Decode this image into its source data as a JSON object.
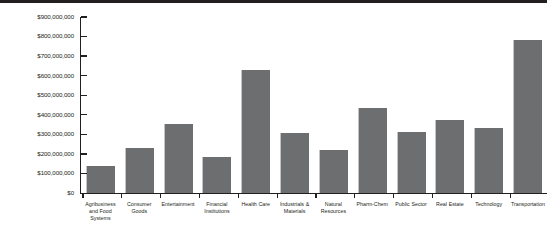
{
  "chart_data": {
    "type": "bar",
    "title": "",
    "subtitle": "",
    "xlabel": "",
    "ylabel": "",
    "categories": [
      "Agribusiness and Food Systems",
      "Consumer Goods",
      "Entertainment",
      "Financial Institutions",
      "Health Care",
      "Industrials & Materials",
      "Natural Resources",
      "Pharm-Chem",
      "Public Sector",
      "Real Estate",
      "Technology",
      "Transportation"
    ],
    "values": [
      140000000,
      230000000,
      355000000,
      185000000,
      630000000,
      305000000,
      220000000,
      435000000,
      310000000,
      375000000,
      335000000,
      780000000
    ],
    "ylim": [
      0,
      900000000
    ],
    "ytick_values": [
      0,
      100000000,
      200000000,
      300000000,
      400000000,
      500000000,
      600000000,
      700000000,
      800000000,
      900000000
    ],
    "ytick_labels": [
      "$0",
      "$100,000,000",
      "$200,000,000",
      "$300,000,000",
      "$400,000,000",
      "$500,000,000",
      "$600,000,000",
      "$700,000,000",
      "$800,000,000",
      "$900,000,000"
    ],
    "grid": false,
    "legend": null,
    "legend_position": "none",
    "bar_color": "#6d6e70",
    "axis_color": "#231f20",
    "background_color": "#ffffff"
  }
}
